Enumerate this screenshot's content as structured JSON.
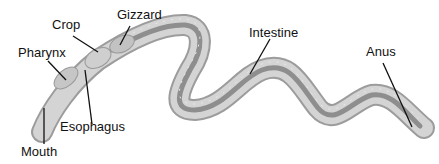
{
  "diagram": {
    "labels": {
      "pharynx": "Pharynx",
      "crop": "Crop",
      "gizzard": "Gizzard",
      "intestine": "Intestine",
      "anus": "Anus",
      "esophagus": "Esophagus",
      "mouth": "Mouth"
    },
    "colors": {
      "body_outer": "#b8b8b8",
      "body_mid": "#d6d6d6",
      "body_inner": "#9a9a9a",
      "gut": "#8a8a8a",
      "leader": "#111111",
      "text": "#111111"
    }
  }
}
